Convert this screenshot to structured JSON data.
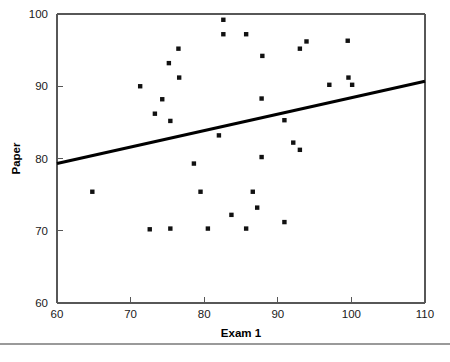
{
  "chart_data": {
    "type": "scatter",
    "title": "",
    "xlabel": "Exam 1",
    "ylabel": "Paper",
    "xlim": [
      60,
      110
    ],
    "ylim": [
      60,
      100
    ],
    "xticks": [
      60,
      70,
      80,
      90,
      100,
      110
    ],
    "yticks": [
      60,
      70,
      80,
      90,
      100
    ],
    "xticklabels": [
      "60",
      "70",
      "80",
      "90",
      "100",
      "110"
    ],
    "yticklabels": [
      "60",
      "70",
      "80",
      "90",
      "100"
    ],
    "grid": false,
    "legend": false,
    "marker": "square",
    "marker_color": "#111111",
    "points": [
      {
        "x": 64.8,
        "y": 75.4
      },
      {
        "x": 71.3,
        "y": 90.0
      },
      {
        "x": 72.6,
        "y": 70.2
      },
      {
        "x": 73.3,
        "y": 86.2
      },
      {
        "x": 74.3,
        "y": 88.2
      },
      {
        "x": 75.2,
        "y": 93.2
      },
      {
        "x": 75.4,
        "y": 85.2
      },
      {
        "x": 75.4,
        "y": 70.3
      },
      {
        "x": 76.5,
        "y": 95.2
      },
      {
        "x": 76.6,
        "y": 91.2
      },
      {
        "x": 78.6,
        "y": 79.3
      },
      {
        "x": 79.5,
        "y": 75.4
      },
      {
        "x": 80.5,
        "y": 70.3
      },
      {
        "x": 82.0,
        "y": 83.2
      },
      {
        "x": 82.6,
        "y": 99.2
      },
      {
        "x": 82.6,
        "y": 97.2
      },
      {
        "x": 83.7,
        "y": 72.2
      },
      {
        "x": 85.7,
        "y": 97.2
      },
      {
        "x": 85.7,
        "y": 70.3
      },
      {
        "x": 86.6,
        "y": 75.4
      },
      {
        "x": 87.2,
        "y": 73.2
      },
      {
        "x": 87.8,
        "y": 80.2
      },
      {
        "x": 87.8,
        "y": 88.3
      },
      {
        "x": 87.9,
        "y": 94.2
      },
      {
        "x": 90.9,
        "y": 71.2
      },
      {
        "x": 90.9,
        "y": 85.3
      },
      {
        "x": 92.1,
        "y": 82.2
      },
      {
        "x": 93.0,
        "y": 81.2
      },
      {
        "x": 93.0,
        "y": 95.2
      },
      {
        "x": 93.9,
        "y": 96.2
      },
      {
        "x": 97.0,
        "y": 90.2
      },
      {
        "x": 99.5,
        "y": 96.3
      },
      {
        "x": 99.6,
        "y": 91.2
      },
      {
        "x": 100.1,
        "y": 90.2
      }
    ],
    "fit_line": {
      "name": "regression-line",
      "x_start": 60,
      "y_start": 79.3,
      "x_end": 110,
      "y_end": 90.7,
      "color": "#000000"
    }
  }
}
